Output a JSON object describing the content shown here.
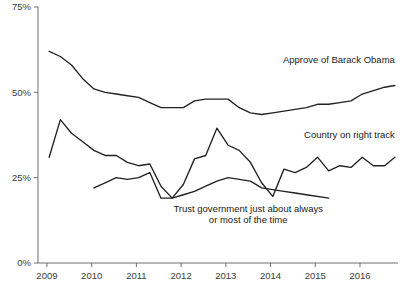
{
  "chart_data": {
    "type": "line",
    "title": "",
    "xlabel": "",
    "ylabel": "",
    "ylim": [
      0,
      75
    ],
    "xlim": [
      2008.8,
      2016.85
    ],
    "grid": false,
    "legend_position": "inline-annotations",
    "ytick_labels": [
      "0%",
      "25%",
      "50%",
      "75%"
    ],
    "ytick_values": [
      0,
      25,
      50,
      75
    ],
    "xtick_labels": [
      "2009",
      "2010",
      "2011",
      "2012",
      "2013",
      "2014",
      "2015",
      "2016"
    ],
    "xtick_values": [
      2009,
      2010,
      2011,
      2012,
      2013,
      2014,
      2015,
      2016
    ],
    "series": [
      {
        "name": "Approve of Barack Obama",
        "label_anchor": "end",
        "label_x": 2016.78,
        "label_y": 58.5,
        "x": [
          2009.05,
          2009.3,
          2009.55,
          2009.8,
          2010.05,
          2010.3,
          2010.55,
          2010.8,
          2011.05,
          2011.3,
          2011.55,
          2011.8,
          2012.05,
          2012.3,
          2012.55,
          2012.8,
          2013.05,
          2013.3,
          2013.55,
          2013.8,
          2014.05,
          2014.3,
          2014.55,
          2014.8,
          2015.05,
          2015.3,
          2015.55,
          2015.8,
          2016.05,
          2016.3,
          2016.55,
          2016.78
        ],
        "values": [
          62,
          60.5,
          58,
          54,
          51,
          50,
          49.5,
          49,
          48.5,
          47,
          45.5,
          45.5,
          45.5,
          47.5,
          48,
          48,
          48,
          45.5,
          44,
          43.5,
          44,
          44.5,
          45,
          45.5,
          46.5,
          46.5,
          47,
          47.5,
          49.5,
          50.5,
          51.5,
          52
        ]
      },
      {
        "name": "Country on right track",
        "label_anchor": "end",
        "label_x": 2016.78,
        "label_y": 36.5,
        "x": [
          2009.05,
          2009.3,
          2009.55,
          2009.8,
          2010.05,
          2010.3,
          2010.55,
          2010.8,
          2011.05,
          2011.3,
          2011.55,
          2011.8,
          2012.05,
          2012.3,
          2012.55,
          2012.8,
          2013.05,
          2013.3,
          2013.55,
          2013.8,
          2014.05,
          2014.3,
          2014.55,
          2014.8,
          2015.05,
          2015.3,
          2015.55,
          2015.8,
          2016.05,
          2016.3,
          2016.55,
          2016.78
        ],
        "values": [
          31,
          42,
          38,
          35.5,
          33,
          31.5,
          31.5,
          29.5,
          28.5,
          29,
          22.5,
          19,
          23,
          30.5,
          31.5,
          39.5,
          34.5,
          33,
          29.5,
          23.5,
          19.5,
          27.5,
          26.5,
          28,
          31,
          27,
          28.5,
          28,
          31,
          28.5,
          28.5,
          31
        ]
      },
      {
        "name": "Trust government just about always or most of the time",
        "label_anchor": "middle",
        "label_x": 2013.5,
        "label_y": 15.0,
        "label_lines": [
          "Trust government just about always",
          "or most of the time"
        ],
        "x": [
          2010.05,
          2010.3,
          2010.55,
          2010.8,
          2011.05,
          2011.3,
          2011.55,
          2011.8,
          2012.05,
          2012.3,
          2012.55,
          2012.8,
          2013.05,
          2013.3,
          2013.55,
          2013.8,
          2014.05,
          2014.3,
          2014.55,
          2014.8,
          2015.3
        ],
        "values": [
          22,
          23.5,
          25,
          24.5,
          25,
          26.5,
          19,
          19,
          20,
          21,
          22.5,
          24,
          25,
          24.5,
          24,
          22,
          21.5,
          21,
          20.5,
          20,
          19
        ]
      }
    ]
  }
}
